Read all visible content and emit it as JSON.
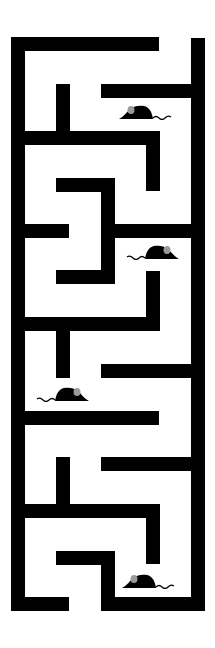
{
  "game": {
    "type": "maze",
    "colors": {
      "wall": "#000000",
      "floor": "#ffffff",
      "mouse_body": "#000000",
      "mouse_ear": "#9a9a9a"
    },
    "walls": [
      {
        "id": "top-left",
        "x": 11,
        "y": 37,
        "w": 148,
        "h": 14
      },
      {
        "id": "outer-left",
        "x": 11,
        "y": 37,
        "w": 14,
        "h": 574
      },
      {
        "id": "outer-right",
        "x": 191,
        "y": 38,
        "w": 14,
        "h": 573
      },
      {
        "id": "bottom-left",
        "x": 11,
        "y": 597,
        "w": 58,
        "h": 14
      },
      {
        "id": "bottom-right",
        "x": 101,
        "y": 597,
        "w": 104,
        "h": 14
      },
      {
        "id": "h1-right",
        "x": 101,
        "y": 84,
        "w": 90,
        "h": 14
      },
      {
        "id": "v1-post",
        "x": 56,
        "y": 84,
        "w": 14,
        "h": 50
      },
      {
        "id": "h2-left",
        "x": 11,
        "y": 131,
        "w": 148,
        "h": 14
      },
      {
        "id": "v2-right",
        "x": 146,
        "y": 131,
        "w": 14,
        "h": 60
      },
      {
        "id": "h3-mid",
        "x": 56,
        "y": 178,
        "w": 58,
        "h": 14
      },
      {
        "id": "v3-mid",
        "x": 101,
        "y": 178,
        "w": 14,
        "h": 106
      },
      {
        "id": "h4-right",
        "x": 101,
        "y": 224,
        "w": 90,
        "h": 14
      },
      {
        "id": "h4-left",
        "x": 11,
        "y": 224,
        "w": 58,
        "h": 14
      },
      {
        "id": "h5-mid",
        "x": 56,
        "y": 270,
        "w": 58,
        "h": 14
      },
      {
        "id": "v5-right",
        "x": 146,
        "y": 271,
        "w": 14,
        "h": 60
      },
      {
        "id": "h6-left",
        "x": 11,
        "y": 317,
        "w": 148,
        "h": 14
      },
      {
        "id": "v6-post",
        "x": 56,
        "y": 317,
        "w": 14,
        "h": 61
      },
      {
        "id": "h7-right",
        "x": 101,
        "y": 364,
        "w": 90,
        "h": 14
      },
      {
        "id": "h8-left",
        "x": 11,
        "y": 411,
        "w": 148,
        "h": 14
      },
      {
        "id": "h9-right",
        "x": 101,
        "y": 457,
        "w": 90,
        "h": 14
      },
      {
        "id": "v9-post",
        "x": 56,
        "y": 457,
        "w": 14,
        "h": 50
      },
      {
        "id": "h10-left",
        "x": 11,
        "y": 504,
        "w": 148,
        "h": 14
      },
      {
        "id": "v10-right",
        "x": 146,
        "y": 504,
        "w": 14,
        "h": 60
      },
      {
        "id": "h11-mid",
        "x": 56,
        "y": 551,
        "w": 58,
        "h": 14
      },
      {
        "id": "v11-mid",
        "x": 101,
        "y": 551,
        "w": 14,
        "h": 60
      }
    ],
    "mice": [
      {
        "id": "mouse-1",
        "x": 117,
        "y": 104,
        "facing": "left"
      },
      {
        "id": "mouse-2",
        "x": 125,
        "y": 244,
        "facing": "right"
      },
      {
        "id": "mouse-3",
        "x": 35,
        "y": 386,
        "facing": "right"
      },
      {
        "id": "mouse-4",
        "x": 120,
        "y": 573,
        "facing": "left"
      }
    ]
  }
}
